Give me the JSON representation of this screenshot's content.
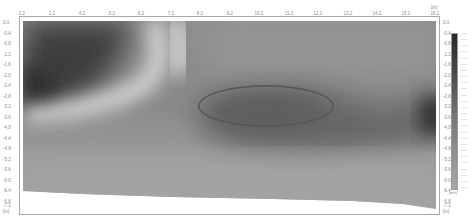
{
  "chart_data": {
    "type": "heatmap",
    "title": "",
    "xlabel": "[m]",
    "ylabel": "[m]",
    "x_ticks": [
      "2.2",
      "3.2",
      "4.2",
      "5.2",
      "6.2",
      "7.2",
      "8.2",
      "9.2",
      "10.2",
      "11.2",
      "12.2",
      "13.2",
      "14.2",
      "15.2",
      "16.2"
    ],
    "xlim": [
      2.2,
      16.2
    ],
    "y_ticks": [
      "0.0",
      "-0.4",
      "-0.8",
      "-1.2",
      "-1.6",
      "-2.0",
      "-2.4",
      "-2.8",
      "-3.2",
      "-3.6",
      "-4.0",
      "-4.4",
      "-4.8",
      "-5.2",
      "-5.6",
      "-6.0",
      "-6.4",
      "-6.8",
      "-7.2"
    ],
    "ylim": [
      -7.2,
      0.0
    ],
    "x_unit": "[m]",
    "y_unit_left": "[m]",
    "y_unit_right": "[m]",
    "colorbar": {
      "orientation": "vertical",
      "gradient": [
        "#2a2a2a",
        "#4a4a4a",
        "#707070",
        "#8e8e8e",
        "#a8a8a8"
      ],
      "tick_count": 26,
      "unit": "[m/s]"
    },
    "annotation": {
      "shape": "ellipse",
      "color": "#555555",
      "center_x_m": 10.2,
      "center_y_m": -3.1,
      "description": "Ellipse enclosing a low-value (dark) zone"
    },
    "grid": false,
    "legend": "none"
  }
}
